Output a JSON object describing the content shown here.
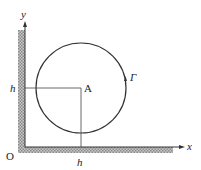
{
  "diagram": {
    "labels": {
      "y_axis": "y",
      "x_axis": "x",
      "origin": "O",
      "center": "A",
      "h_left": "h",
      "h_bottom": "h",
      "curve": "Γ"
    },
    "colors": {
      "line": "#333333",
      "hatch": "#9a9a9a"
    }
  }
}
